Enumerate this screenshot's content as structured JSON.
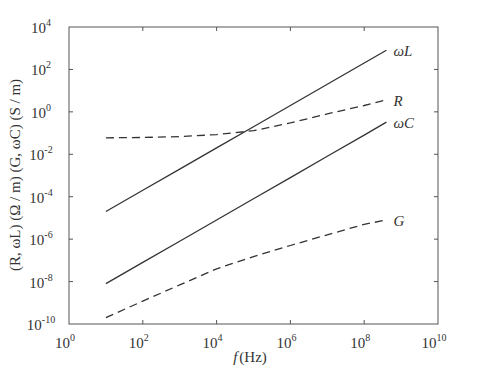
{
  "chart_data": {
    "type": "line",
    "title": "",
    "xlabel": "f (Hz)",
    "xlabel_parts": {
      "italic": "f",
      "rest": "(Hz)"
    },
    "ylabel": "(R, ωL) (Ω / m)  (G, ωC) (S / m)",
    "x_scale": "log",
    "y_scale": "log",
    "xlim": [
      1,
      10000000000
    ],
    "ylim": [
      1e-10,
      10000
    ],
    "grid": false,
    "legend": "inline labels at right end of each curve",
    "x_ticks": [
      {
        "base": "10",
        "exp": "0",
        "value": 0
      },
      {
        "base": "10",
        "exp": "2",
        "value": 2
      },
      {
        "base": "10",
        "exp": "4",
        "value": 4
      },
      {
        "base": "10",
        "exp": "6",
        "value": 6
      },
      {
        "base": "10",
        "exp": "8",
        "value": 8
      },
      {
        "base": "10",
        "exp": "10",
        "value": 10
      }
    ],
    "y_ticks": [
      {
        "base": "10",
        "exp": "4",
        "value": 4
      },
      {
        "base": "10",
        "exp": "2",
        "value": 2
      },
      {
        "base": "10",
        "exp": "0",
        "value": 0
      },
      {
        "base": "10",
        "exp": "-2",
        "value": -2
      },
      {
        "base": "10",
        "exp": "-4",
        "value": -4
      },
      {
        "base": "10",
        "exp": "-6",
        "value": -6
      },
      {
        "base": "10",
        "exp": "-8",
        "value": -8
      },
      {
        "base": "10",
        "exp": "-10",
        "value": -10
      }
    ],
    "series": [
      {
        "name": "ωL",
        "style": "solid",
        "x": [
          10,
          100,
          1000,
          10000,
          100000,
          1000000,
          10000000,
          100000000,
          400000000
        ],
        "y": [
          2e-05,
          0.0002,
          0.002,
          0.02,
          0.2,
          2,
          20,
          200,
          800
        ]
      },
      {
        "name": "R",
        "style": "dashed",
        "x": [
          10,
          100,
          1000,
          10000,
          100000,
          1000000,
          10000000,
          100000000,
          400000000
        ],
        "y": [
          0.06,
          0.062,
          0.068,
          0.085,
          0.13,
          0.3,
          0.8,
          2.0,
          3.7
        ]
      },
      {
        "name": "ωC",
        "style": "solid",
        "x": [
          10,
          100,
          1000,
          10000,
          100000,
          1000000,
          10000000,
          100000000,
          400000000
        ],
        "y": [
          8e-09,
          8e-08,
          8e-07,
          8e-06,
          8e-05,
          0.0008,
          0.008,
          0.08,
          0.33
        ]
      },
      {
        "name": "G",
        "style": "dashed",
        "x": [
          10,
          100,
          1000,
          10000,
          100000,
          1000000,
          10000000,
          100000000,
          400000000
        ],
        "y": [
          2e-10,
          1.2e-09,
          7e-09,
          4e-08,
          1.5e-07,
          5e-07,
          1.6e-06,
          5e-06,
          8e-06
        ]
      }
    ],
    "series_labels": [
      {
        "series": "ωL",
        "text": "ωL"
      },
      {
        "series": "R",
        "text": "R"
      },
      {
        "series": "ωC",
        "text": "ωC"
      },
      {
        "series": "G",
        "text": "G"
      }
    ]
  }
}
